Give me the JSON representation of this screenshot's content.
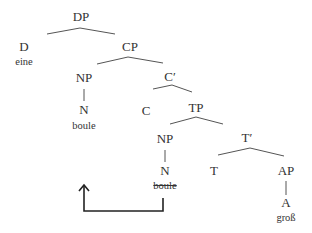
{
  "tree": {
    "nodes": {
      "dp": "DP",
      "d": "D",
      "d_word": "eine",
      "cp": "CP",
      "np1": "NP",
      "n1": "N",
      "n1_word": "boule",
      "cbar": "C′",
      "c": "C",
      "tp": "TP",
      "np2": "NP",
      "n2": "N",
      "n2_word": "boule",
      "tbar": "T′",
      "t": "T",
      "ap": "AP",
      "a": "A",
      "a_word": "groß"
    },
    "movement": {
      "from": "boule (TP-internal NP, struck through)",
      "to": "NP in Spec-CP"
    },
    "colors": {
      "line": "#444444",
      "text": "#333333",
      "arrow": "#222222"
    }
  }
}
